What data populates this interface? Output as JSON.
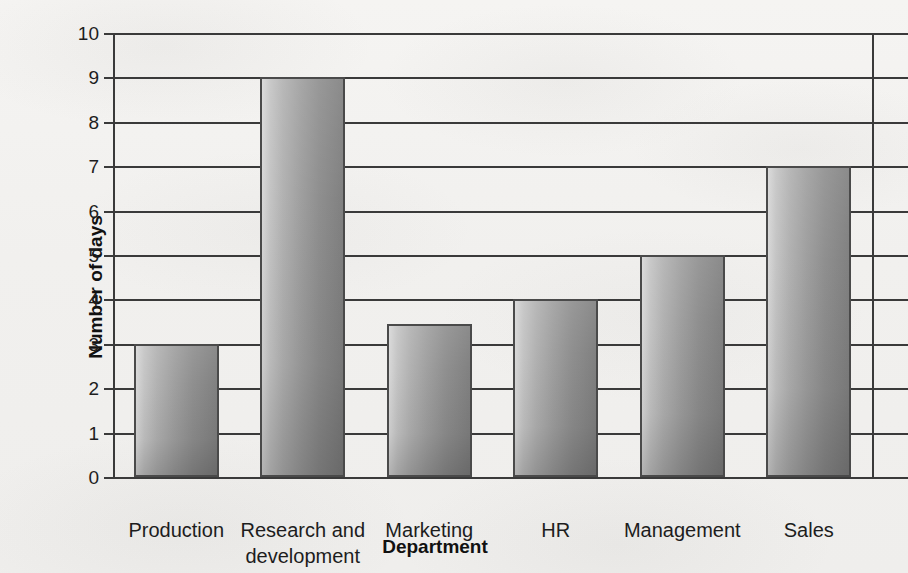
{
  "chart_data": {
    "type": "bar",
    "title": "",
    "subtitle": "",
    "xlabel": "Department",
    "ylabel": "Number of days",
    "categories": [
      "Production",
      "Research and development",
      "Marketing",
      "HR",
      "Management",
      "Sales"
    ],
    "category_lines": [
      [
        "Production"
      ],
      [
        "Research and",
        "development"
      ],
      [
        "Marketing"
      ],
      [
        "HR"
      ],
      [
        "Management"
      ],
      [
        "Sales"
      ]
    ],
    "values": [
      3,
      9,
      3.45,
      4,
      5,
      7
    ],
    "ylim": [
      0,
      10
    ],
    "ytick_labels": [
      "0",
      "1",
      "2",
      "3",
      "4",
      "5",
      "6",
      "7",
      "8",
      "9",
      "10"
    ],
    "ytick_values": [
      0,
      1,
      2,
      3,
      4,
      5,
      6,
      7,
      8,
      9,
      10
    ],
    "ytick_step": 1,
    "grid": "horizontal",
    "legend": "none",
    "bar_fill": "#9d9d9d",
    "bar_fill_light": "#d7d7d7",
    "bar_fill_dark": "#7e7e7e",
    "bar_edge_color": "#4a4a4a",
    "axis_color": "#3a3a3a",
    "background_color": "#f3f2f0",
    "text_color": "#1d1d1d"
  }
}
